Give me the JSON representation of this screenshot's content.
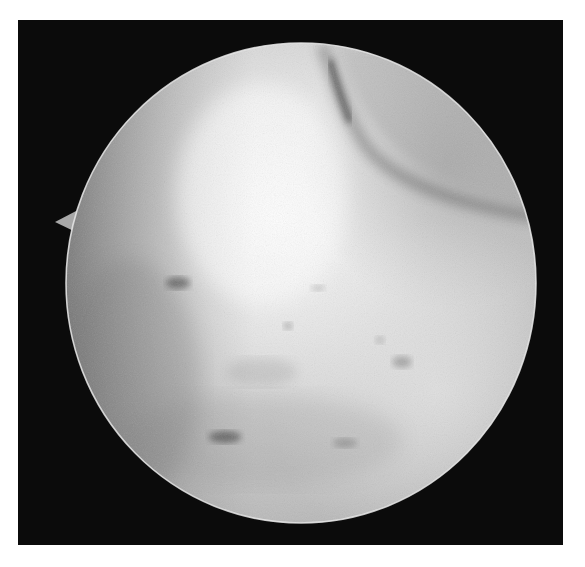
{
  "image": {
    "kind": "arthroscopic-view",
    "colormode": "grayscale",
    "background": "#ffffff",
    "frame": {
      "x": 18,
      "y": 20,
      "width": 545,
      "height": 525,
      "color": "#0b0b0b"
    },
    "scope_circle": {
      "cx": 301,
      "cy": 283,
      "rx": 235,
      "ry": 240,
      "rim_color": "#e8e8e8",
      "base_tone": "#c4c4c4",
      "highlight": {
        "cx": 262,
        "cy": 195,
        "tone": "#fbfbfb"
      },
      "left_shadow_tone": "#7a7a7a"
    },
    "orientation_notch": {
      "tip_x": 55,
      "tip_y": 222,
      "side": "left",
      "tone": "#a8a8a8"
    },
    "features": {
      "upper_right_crease": [
        {
          "x": 325,
          "y": 48
        },
        {
          "x": 345,
          "y": 115
        },
        {
          "x": 380,
          "y": 160
        },
        {
          "x": 450,
          "y": 198
        },
        {
          "x": 525,
          "y": 214
        }
      ],
      "dark_spots": [
        {
          "x": 178,
          "y": 283,
          "rx": 12,
          "ry": 6,
          "opacity": 0.55
        },
        {
          "x": 318,
          "y": 288,
          "rx": 7,
          "ry": 3,
          "opacity": 0.25
        },
        {
          "x": 288,
          "y": 326,
          "rx": 5,
          "ry": 4,
          "opacity": 0.3
        },
        {
          "x": 380,
          "y": 340,
          "rx": 5,
          "ry": 4,
          "opacity": 0.22
        },
        {
          "x": 402,
          "y": 362,
          "rx": 10,
          "ry": 6,
          "opacity": 0.35
        },
        {
          "x": 225,
          "y": 437,
          "rx": 16,
          "ry": 6,
          "opacity": 0.55
        },
        {
          "x": 345,
          "y": 443,
          "rx": 12,
          "ry": 5,
          "opacity": 0.3
        },
        {
          "x": 262,
          "y": 372,
          "rx": 35,
          "ry": 14,
          "opacity": 0.15
        }
      ]
    }
  }
}
